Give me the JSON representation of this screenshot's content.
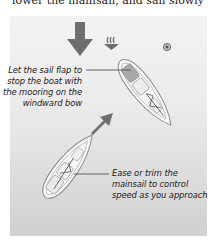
{
  "header": {
    "partial_text": "lower the mainsail, and sail slowly"
  },
  "diagram": {
    "wind_direction": "down",
    "icons": {
      "wind_arrow": "large-down-arrow",
      "tide_symbol": "wavy-down-arrow",
      "mooring_buoy": "circle-buoy",
      "course_arrow": "diagonal-up-right-arrow"
    },
    "annotations": {
      "upper": {
        "lines": [
          "Let the sail flap to",
          "stop the boat with",
          "the mooring on the",
          "windward bow"
        ]
      },
      "lower": {
        "lines": [
          "Ease or trim the",
          "mainsail to control",
          "speed as you approach"
        ]
      }
    },
    "colors": {
      "panel_top": "#f3f3f3",
      "panel_bottom": "#d0d0d0",
      "arrow": "#6e6e6e",
      "boat_outline": "#8a8a8a",
      "boat_fill": "#f7f7f7",
      "cockpit": "#a9a9a9",
      "text": "#222222"
    }
  }
}
